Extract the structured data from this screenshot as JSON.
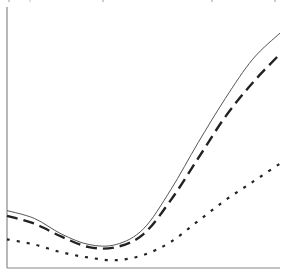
{
  "chart_data": {
    "type": "line",
    "title": "",
    "xlabel": "",
    "ylabel": "",
    "grid": false,
    "legend": null,
    "x": [
      0,
      0.1,
      0.2,
      0.3,
      0.4,
      0.5,
      0.6,
      0.7,
      0.8,
      0.9,
      1.0
    ],
    "xlim": [
      0,
      1
    ],
    "ylim": [
      0,
      1
    ],
    "series": [
      {
        "name": "solid",
        "style": "solid",
        "color": "#555555",
        "values": [
          0.22,
          0.19,
          0.13,
          0.09,
          0.09,
          0.15,
          0.3,
          0.48,
          0.65,
          0.8,
          0.9
        ]
      },
      {
        "name": "dashed",
        "style": "dashed",
        "color": "#222222",
        "values": [
          0.2,
          0.17,
          0.12,
          0.08,
          0.08,
          0.13,
          0.26,
          0.42,
          0.58,
          0.71,
          0.82
        ]
      },
      {
        "name": "dotted",
        "style": "dotted",
        "color": "#222222",
        "values": [
          0.11,
          0.09,
          0.06,
          0.04,
          0.03,
          0.05,
          0.1,
          0.18,
          0.26,
          0.33,
          0.4
        ]
      }
    ]
  },
  "plot": {
    "left": 7,
    "top": 7,
    "right": 280,
    "bottom": 268
  }
}
